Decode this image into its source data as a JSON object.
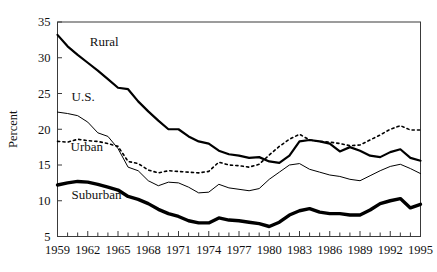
{
  "chart_data": {
    "type": "line",
    "title": "",
    "xlabel": "",
    "ylabel": "Percent",
    "xlim": [
      1959,
      1995
    ],
    "ylim": [
      5,
      35
    ],
    "yticks": [
      5,
      10,
      15,
      20,
      25,
      30,
      35
    ],
    "ytick_labels": [
      "5",
      "10",
      "15",
      "20",
      "25",
      "30",
      "35"
    ],
    "xticks": [
      1959,
      1962,
      1965,
      1968,
      1971,
      1974,
      1977,
      1980,
      1983,
      1986,
      1989,
      1992,
      1995
    ],
    "xtick_labels": [
      "1959",
      "1962",
      "1965",
      "1968",
      "1971",
      "1974",
      "1977",
      "1980",
      "1983",
      "1986",
      "1989",
      "1992",
      "1995"
    ],
    "x": [
      1959,
      1960,
      1961,
      1962,
      1963,
      1964,
      1965,
      1966,
      1967,
      1968,
      1969,
      1970,
      1971,
      1972,
      1973,
      1974,
      1975,
      1976,
      1977,
      1978,
      1979,
      1980,
      1981,
      1982,
      1983,
      1984,
      1985,
      1986,
      1987,
      1988,
      1989,
      1990,
      1991,
      1992,
      1993,
      1994,
      1995
    ],
    "grid": false,
    "legend": "inline-labels",
    "series": [
      {
        "name": "Rural",
        "style": "solid",
        "line_width": 2.2,
        "color": "#000000",
        "label_x": 1962.2,
        "label_y": 31.6,
        "values": [
          33.2,
          31.6,
          30.4,
          29.3,
          28.2,
          27.0,
          25.8,
          25.6,
          23.9,
          22.5,
          21.2,
          20.0,
          20.0,
          19.0,
          18.3,
          18.0,
          17.0,
          16.5,
          16.3,
          16.0,
          16.1,
          15.5,
          15.3,
          16.3,
          18.3,
          18.5,
          18.3,
          18.0,
          16.9,
          17.5,
          17.0,
          16.3,
          16.1,
          16.8,
          17.2,
          16.0,
          15.6
        ]
      },
      {
        "name": "U.S.",
        "style": "solid",
        "line_width": 1.0,
        "color": "#000000",
        "label_x": 1960.4,
        "label_y": 24.0,
        "values": [
          22.4,
          22.2,
          21.9,
          21.0,
          19.5,
          19.0,
          17.3,
          14.7,
          14.2,
          12.8,
          12.1,
          12.6,
          12.5,
          11.9,
          11.1,
          11.2,
          12.3,
          11.8,
          11.6,
          11.4,
          11.7,
          13.0,
          14.0,
          15.0,
          15.2,
          14.4,
          14.0,
          13.6,
          13.4,
          13.0,
          12.8,
          13.5,
          14.2,
          14.8,
          15.1,
          14.5,
          13.8
        ]
      },
      {
        "name": "Urban",
        "style": "dotted",
        "line_width": 1.6,
        "color": "#000000",
        "label_x": 1960.3,
        "label_y": 16.9,
        "values": [
          18.3,
          18.2,
          18.6,
          18.4,
          18.3,
          18.0,
          17.6,
          15.5,
          15.2,
          14.3,
          13.9,
          14.2,
          14.1,
          14.0,
          13.9,
          14.1,
          15.4,
          15.0,
          14.9,
          14.7,
          15.1,
          16.4,
          17.6,
          18.6,
          19.3,
          18.5,
          18.3,
          18.2,
          18.0,
          17.7,
          17.8,
          18.5,
          19.2,
          20.0,
          20.5,
          19.9,
          19.9
        ]
      },
      {
        "name": "Suburban",
        "style": "solid",
        "line_width": 3.4,
        "color": "#000000",
        "label_x": 1960.4,
        "label_y": 10.2,
        "values": [
          12.2,
          12.5,
          12.7,
          12.6,
          12.3,
          11.9,
          11.5,
          10.6,
          10.2,
          9.6,
          8.8,
          8.2,
          7.8,
          7.2,
          6.9,
          6.9,
          7.6,
          7.3,
          7.2,
          7.0,
          6.8,
          6.4,
          7.0,
          8.0,
          8.6,
          8.9,
          8.4,
          8.2,
          8.2,
          8.0,
          8.0,
          8.7,
          9.6,
          10.0,
          10.3,
          9.0,
          9.5
        ]
      }
    ]
  }
}
